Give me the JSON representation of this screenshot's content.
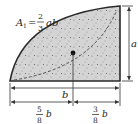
{
  "diagram": {
    "area_formula": {
      "lhs": "A",
      "lhs_sub": "1",
      "equals": "=",
      "num": "2",
      "den": "3",
      "vars": "ab"
    },
    "dimensions": {
      "height_label": "a",
      "width_label": "b",
      "left_segment": {
        "num": "5",
        "den": "8",
        "var": "b"
      },
      "right_segment": {
        "num": "3",
        "den": "8",
        "var": "b"
      }
    },
    "colors": {
      "fill": "#d4d4d4",
      "stroke": "#2a2a2a",
      "dim_line": "#333333",
      "speckle": "#777777"
    }
  }
}
